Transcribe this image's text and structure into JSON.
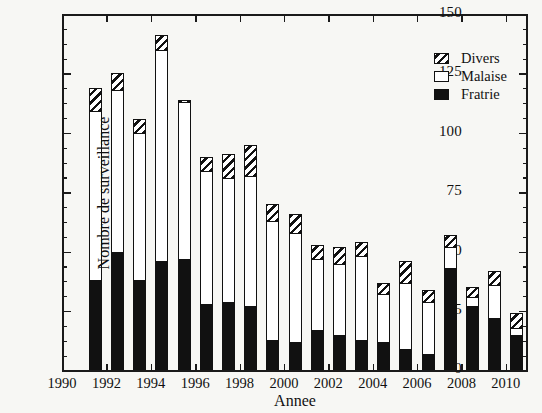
{
  "chart_data": {
    "type": "bar",
    "stacked": true,
    "title": "",
    "xlabel": "Annee",
    "ylabel": "Nombre de surveillance",
    "xlim": [
      1990,
      2011
    ],
    "ylim": [
      0,
      150
    ],
    "yticks": [
      0,
      25,
      50,
      75,
      100,
      125,
      150
    ],
    "y_minor_step": 6.25,
    "xticks": [
      1990,
      1992,
      1994,
      1996,
      1998,
      2000,
      2002,
      2004,
      2006,
      2008,
      2010
    ],
    "grid": false,
    "legend_position": "top-right",
    "categories": [
      1991,
      1992,
      1993,
      1994,
      1995,
      1996,
      1997,
      1998,
      1999,
      2000,
      2001,
      2002,
      2003,
      2004,
      2005,
      2006,
      2007,
      2008,
      2009,
      2010
    ],
    "series": [
      {
        "name": "Fratrie",
        "color": "#111111",
        "pattern": "solid",
        "values": [
          38,
          50,
          38,
          46,
          47,
          28,
          29,
          27,
          13,
          12,
          17,
          15,
          13,
          12,
          9,
          7,
          43,
          27,
          22,
          15
        ]
      },
      {
        "name": "Malaise",
        "color": "#ffffff",
        "pattern": "open",
        "values": [
          71,
          68,
          62,
          89,
          66,
          56,
          52,
          55,
          50,
          46,
          30,
          30,
          35,
          20,
          28,
          22,
          9,
          4,
          14,
          3
        ]
      },
      {
        "name": "Divers",
        "color": "#111111",
        "pattern": "hatched",
        "values": [
          10,
          7,
          6,
          6,
          1,
          6,
          10,
          13,
          7,
          8,
          6,
          7,
          6,
          5,
          9,
          5,
          5,
          4,
          6,
          6
        ]
      }
    ],
    "totals": [
      119,
      125,
      106,
      141,
      114,
      90,
      91,
      95,
      70,
      66,
      53,
      52,
      54,
      37,
      46,
      34,
      57,
      35,
      42,
      24
    ]
  },
  "legend": {
    "entries": [
      {
        "label": "Divers",
        "swatch": "hatched-swatch"
      },
      {
        "label": "Malaise",
        "swatch": "open-swatch"
      },
      {
        "label": "Fratrie",
        "swatch": "filled-swatch"
      }
    ]
  },
  "axes": {
    "y_tick_labels": [
      "150",
      "125",
      "100",
      "75",
      "50",
      "25",
      "0"
    ],
    "x_tick_labels": [
      "1990",
      "1992",
      "1994",
      "1996",
      "1998",
      "2000",
      "2002",
      "2004",
      "2006",
      "2008",
      "2010"
    ],
    "y_title": "Nombre de surveillance",
    "x_title": "Annee"
  }
}
